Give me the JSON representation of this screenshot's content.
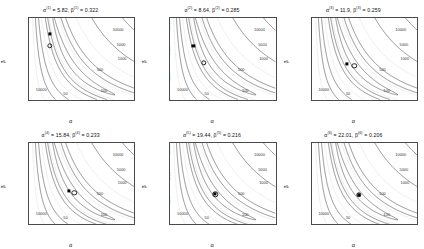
{
  "figure": {
    "type": "contour-grid",
    "rows": 2,
    "cols": 3,
    "xlabel": "α",
    "ylabel": "β"
  },
  "axes": {
    "x": {
      "ticks": [
        0,
        10,
        20,
        30,
        40,
        50
      ],
      "min": 0,
      "max": 52
    },
    "y": {
      "ticks": [
        "0.10",
        "0.15",
        "0.20",
        "0.25",
        "0.30",
        "0.35",
        "0.40"
      ],
      "values": [
        0.1,
        0.15,
        0.2,
        0.25,
        0.3,
        0.35,
        0.4
      ],
      "min": 0.095,
      "max": 0.415
    }
  },
  "contour_levels": [
    10000,
    5000,
    1000,
    500,
    100,
    50
  ],
  "chart_data": {
    "type": "line",
    "title": "",
    "xlabel": "α",
    "ylabel": "β",
    "xlim": [
      0,
      52
    ],
    "ylim": [
      0.095,
      0.415
    ],
    "grid": false,
    "legend": "none",
    "series": [
      {
        "name": "alpha_hat",
        "values": [
          5.82,
          8.64,
          11.9,
          15.84,
          19.44,
          22.01
        ]
      },
      {
        "name": "beta_hat",
        "values": [
          0.322,
          0.285,
          0.259,
          0.233,
          0.216,
          0.206
        ]
      }
    ],
    "panels": [
      {
        "index": 1,
        "title_alpha_sup": "(1)",
        "title_beta_sup": "(1)",
        "alpha": "5.82",
        "beta": "0.322",
        "title": "α(1) = 5.82, β(1) = 0.322",
        "square": {
          "alpha": 10.3,
          "beta": 0.352
        },
        "circle": {
          "alpha": 10.3,
          "beta": 0.307
        },
        "contour_labels": [
          {
            "text": "10000",
            "x": 44.0,
            "y": 0.37
          },
          {
            "text": "5000",
            "x": 45.5,
            "y": 0.312
          },
          {
            "text": "1000",
            "x": 46.0,
            "y": 0.258
          },
          {
            "text": "500",
            "x": 35.0,
            "y": 0.215
          },
          {
            "text": "100",
            "x": 37.0,
            "y": 0.133
          },
          {
            "text": "50",
            "x": 18.0,
            "y": 0.122
          },
          {
            "text": "10000",
            "x": 6.0,
            "y": 0.137
          }
        ]
      },
      {
        "index": 2,
        "title_alpha_sup": "(2)",
        "title_beta_sup": "(2)",
        "alpha": "8.64",
        "beta": "0.285",
        "title": "α(2) = 8.64, β(2) = 0.285",
        "square": {
          "alpha": 11.4,
          "beta": 0.307
        },
        "circle": {
          "alpha": 16.6,
          "beta": 0.24
        },
        "contour_labels": [
          {
            "text": "10000",
            "x": 44.0,
            "y": 0.37
          },
          {
            "text": "5000",
            "x": 45.5,
            "y": 0.312
          },
          {
            "text": "1000",
            "x": 46.0,
            "y": 0.258
          },
          {
            "text": "500",
            "x": 35.0,
            "y": 0.215
          },
          {
            "text": "100",
            "x": 37.0,
            "y": 0.133
          },
          {
            "text": "50",
            "x": 18.0,
            "y": 0.122
          },
          {
            "text": "10000",
            "x": 6.0,
            "y": 0.137
          }
        ]
      },
      {
        "index": 3,
        "title_alpha_sup": "(3)",
        "title_beta_sup": "(3)",
        "alpha": "11.9",
        "beta": "0.259",
        "title": "α(3) = 11.9, β(3) = 0.259",
        "square": {
          "alpha": 17.3,
          "beta": 0.236
        },
        "circle": {
          "alpha": 21.0,
          "beta": 0.228
        },
        "contour_labels": [
          {
            "text": "10000",
            "x": 44.0,
            "y": 0.37
          },
          {
            "text": "5000",
            "x": 45.5,
            "y": 0.312
          },
          {
            "text": "1000",
            "x": 46.0,
            "y": 0.258
          },
          {
            "text": "500",
            "x": 35.0,
            "y": 0.215
          },
          {
            "text": "100",
            "x": 37.0,
            "y": 0.133
          },
          {
            "text": "50",
            "x": 18.0,
            "y": 0.122
          },
          {
            "text": "10000",
            "x": 6.0,
            "y": 0.137
          }
        ]
      },
      {
        "index": 4,
        "title_alpha_sup": "(4)",
        "title_beta_sup": "(4)",
        "alpha": "15.84",
        "beta": "0.233",
        "title": "α(4) = 15.84, β(4) = 0.233",
        "square": {
          "alpha": 19.6,
          "beta": 0.225
        },
        "circle": {
          "alpha": 22.4,
          "beta": 0.217
        },
        "contour_labels": [
          {
            "text": "10000",
            "x": 44.0,
            "y": 0.37
          },
          {
            "text": "5000",
            "x": 45.5,
            "y": 0.312
          },
          {
            "text": "1000",
            "x": 46.0,
            "y": 0.258
          },
          {
            "text": "500",
            "x": 35.0,
            "y": 0.215
          },
          {
            "text": "100",
            "x": 37.0,
            "y": 0.133
          },
          {
            "text": "50",
            "x": 18.0,
            "y": 0.122
          },
          {
            "text": "10000",
            "x": 6.0,
            "y": 0.137
          }
        ]
      },
      {
        "index": 5,
        "title_alpha_sup": "(5)",
        "title_beta_sup": "(5)",
        "alpha": "19.44",
        "beta": "0.216",
        "title": "α(5) = 19.44, β(5) = 0.216",
        "square": {
          "alpha": 22.2,
          "beta": 0.212
        },
        "circle": {
          "alpha": 22.2,
          "beta": 0.212
        },
        "contour_labels": [
          {
            "text": "10000",
            "x": 44.0,
            "y": 0.37
          },
          {
            "text": "5000",
            "x": 45.5,
            "y": 0.312
          },
          {
            "text": "1000",
            "x": 46.0,
            "y": 0.258
          },
          {
            "text": "500",
            "x": 35.0,
            "y": 0.215
          },
          {
            "text": "100",
            "x": 37.0,
            "y": 0.133
          },
          {
            "text": "50",
            "x": 18.0,
            "y": 0.122
          },
          {
            "text": "10000",
            "x": 6.0,
            "y": 0.137
          }
        ]
      },
      {
        "index": 6,
        "title_alpha_sup": "(6)",
        "title_beta_sup": "(6)",
        "alpha": "22.01",
        "beta": "0.206",
        "title": "α(6) = 22.01, β(6) = 0.206",
        "square": {
          "alpha": 23.2,
          "beta": 0.209
        },
        "circle": {
          "alpha": 23.2,
          "beta": 0.209
        },
        "contour_labels": [
          {
            "text": "10000",
            "x": 44.0,
            "y": 0.37
          },
          {
            "text": "5000",
            "x": 45.5,
            "y": 0.312
          },
          {
            "text": "1000",
            "x": 46.0,
            "y": 0.258
          },
          {
            "text": "500",
            "x": 35.0,
            "y": 0.215
          },
          {
            "text": "100",
            "x": 37.0,
            "y": 0.133
          },
          {
            "text": "50",
            "x": 18.0,
            "y": 0.122
          },
          {
            "text": "10000",
            "x": 6.0,
            "y": 0.137
          }
        ]
      }
    ]
  },
  "style": {
    "contour_color": "#3a3a3a",
    "faint_color": "#d9d9d9",
    "axis_color": "#4a4a4a",
    "marker_color": "#000000",
    "background": "#ffffff"
  }
}
